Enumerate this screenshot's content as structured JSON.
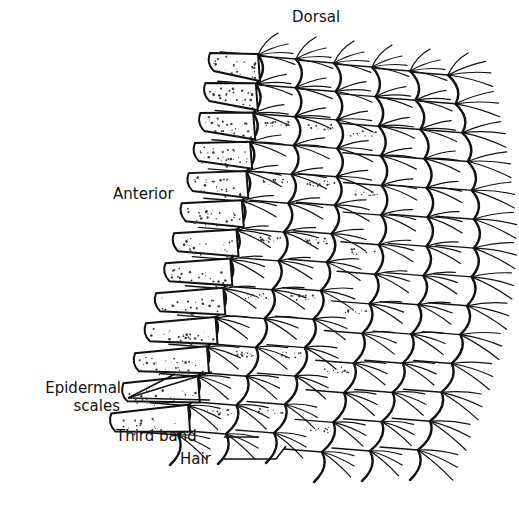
{
  "figure": {
    "colors": {
      "ink": "#111111",
      "background": "#ffffff",
      "stipple": "#333333"
    }
  },
  "labels": {
    "dorsal": "Dorsal",
    "anterior": "Anterior",
    "epidermal_line1": "Epidermal",
    "epidermal_line2": "scales",
    "third_band": "Third band",
    "hair": "Hair"
  }
}
